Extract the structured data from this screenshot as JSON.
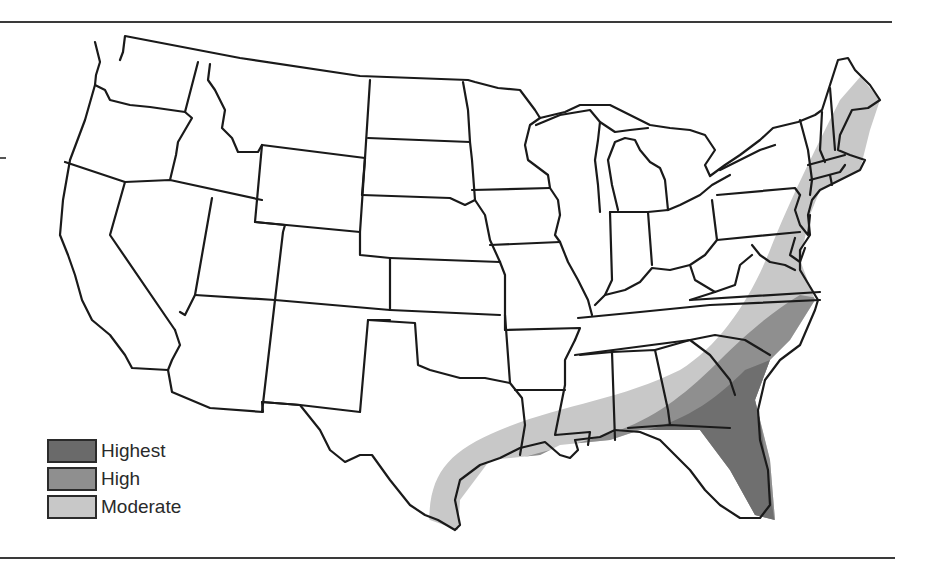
{
  "map": {
    "subject": "Contiguous United States",
    "legend": {
      "items": [
        {
          "label": "Highest",
          "color": "#6a6a6a"
        },
        {
          "label": "High",
          "color": "#8f8f8f"
        },
        {
          "label": "Moderate",
          "color": "#c8c8c8"
        }
      ]
    },
    "zones": [
      {
        "level": "Moderate",
        "region": "Gulf and Atlantic coastal band from south Texas through Louisiana, Mississippi, Alabama, Georgia, the Carolinas, Virginia and north along the Atlantic coast to Maine"
      },
      {
        "level": "High",
        "region": "Louisiana coast, Florida panhandle, southern Georgia, coastal Carolinas and Virginia"
      },
      {
        "level": "Highest",
        "region": "Florida peninsula and immediate southeastern Atlantic coastline"
      }
    ]
  }
}
